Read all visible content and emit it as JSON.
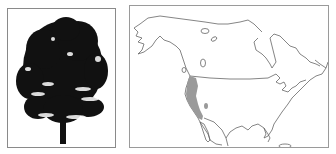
{
  "figure": {
    "tree_panel": {
      "subject": "tree-silhouette",
      "fill_color": "#111111"
    },
    "map_panel": {
      "subject": "north-america-range-map",
      "outline_color": "#666666",
      "range_color": "#9a9a9a",
      "range_region": "Pacific coast of western North America"
    }
  }
}
